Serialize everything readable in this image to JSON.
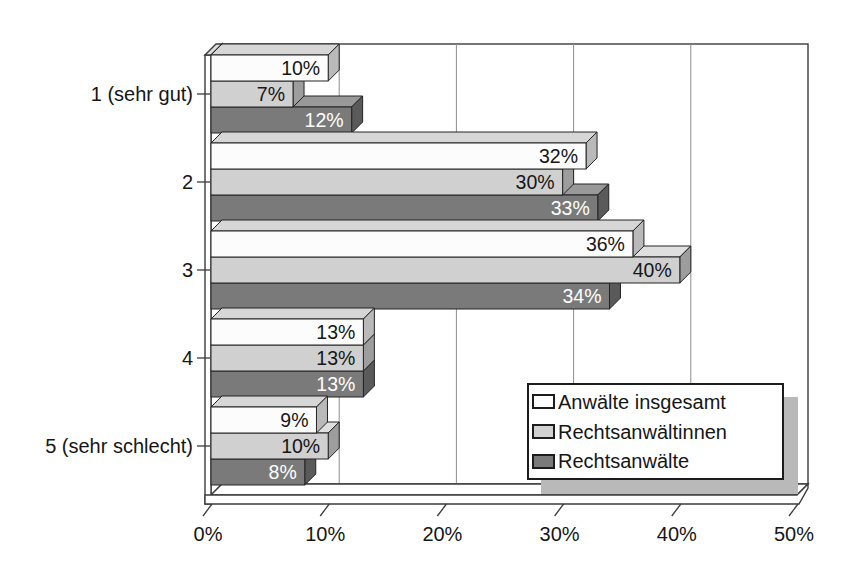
{
  "chart_data": {
    "type": "bar",
    "orientation": "horizontal",
    "style": "3d-oblique",
    "title": "",
    "categories": [
      "1 (sehr gut)",
      "2",
      "3",
      "4",
      "5 (sehr schlecht)"
    ],
    "series": [
      {
        "name": "Anwälte insgesamt",
        "values": [
          10,
          32,
          36,
          13,
          9
        ],
        "front_color": "#fcfcfc",
        "top_color": "#d6d6d6",
        "side_color": "#b9b9b9",
        "label_color": "#161616"
      },
      {
        "name": "Rechtsanwältinnen",
        "values": [
          7,
          30,
          40,
          13,
          10
        ],
        "front_color": "#d0d0d0",
        "top_color": "#dfdfdf",
        "side_color": "#9d9d9d",
        "label_color": "#161616"
      },
      {
        "name": "Rechtsanwälte",
        "values": [
          12,
          33,
          34,
          13,
          8
        ],
        "front_color": "#7a7a7a",
        "top_color": "#999999",
        "side_color": "#5a5a5a",
        "label_color": "#ffffff"
      }
    ],
    "data_label_format": "{value}%",
    "x_axis": {
      "min": 0,
      "max": 50,
      "step": 10,
      "tick_labels": [
        "0%",
        "10%",
        "20%",
        "30%",
        "40%",
        "50%"
      ]
    },
    "grid": true,
    "legend": {
      "position": "inside-bottom-right"
    },
    "colors": {
      "background": "#ffffff",
      "wall_fill": "#ffffff",
      "frame_stroke": "#3c3c3c",
      "gridline": "#8c8c8c",
      "bar_stroke": "#242424",
      "wall_cap_fill": "#dddddd",
      "legend_shadow": "#b9b9b9",
      "text": "#161616"
    }
  }
}
